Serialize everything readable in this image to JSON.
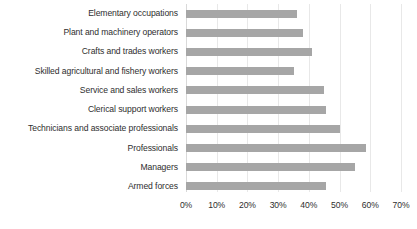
{
  "chart_data": {
    "type": "bar",
    "orientation": "horizontal",
    "title": "",
    "subtitle": "",
    "xlabel": "",
    "ylabel": "",
    "xlim": [
      0,
      70
    ],
    "xtick_labels": [
      "0%",
      "10%",
      "20%",
      "30%",
      "40%",
      "50%",
      "60%",
      "70%"
    ],
    "xtick_values": [
      0,
      10,
      20,
      30,
      40,
      50,
      60,
      70
    ],
    "grid": true,
    "grid_axis": "x",
    "legend": false,
    "value_unit": "%",
    "bar_color": "#a6a6a6",
    "categories": [
      "Elementary occupations",
      "Plant and machinery operators",
      "Crafts and trades workers",
      "Skilled agricultural and fishery workers",
      "Service and sales workers",
      "Clerical support workers",
      "Technicians and associate professionals",
      "Professionals",
      "Managers",
      "Armed forces"
    ],
    "values": [
      36,
      38,
      41,
      35,
      45,
      45.5,
      50,
      58.5,
      55,
      45.5
    ]
  }
}
